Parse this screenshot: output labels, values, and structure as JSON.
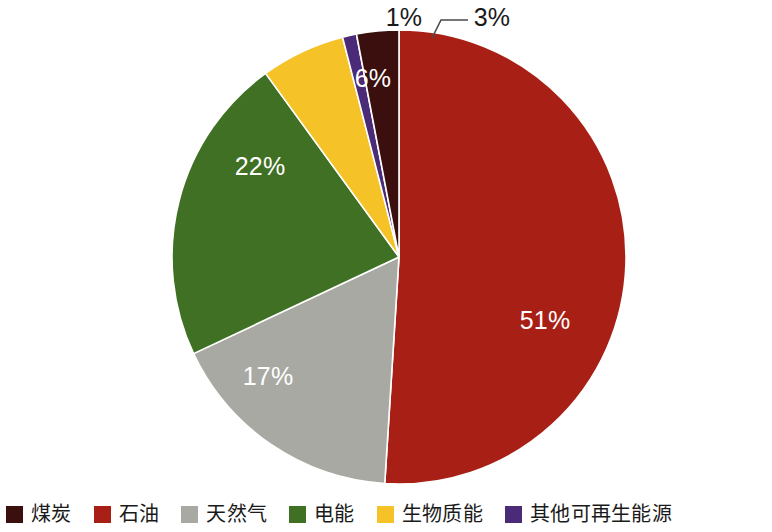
{
  "chart_data": {
    "type": "pie",
    "title": "",
    "subtitle": "",
    "xlabel": "",
    "ylabel": "",
    "legend_position": "bottom",
    "grid": false,
    "unit": "%",
    "start_angle_deg": 0,
    "direction": "clockwise",
    "categories": [
      "石油",
      "天然气",
      "电能",
      "生物质能",
      "其他可再生能源",
      "煤炭"
    ],
    "values": [
      51,
      17,
      22,
      6,
      1,
      3
    ],
    "labels": [
      "51%",
      "17%",
      "22%",
      "6%",
      "1%",
      "3%"
    ],
    "colors": [
      "#A81F16",
      "#A9A9A4",
      "#3F7024",
      "#F5C328",
      "#4B2A77",
      "#3A0F0E"
    ],
    "slices": [
      {
        "name": "石油",
        "value": 51,
        "label": "51%",
        "color": "#A81F16",
        "label_placement": "inside",
        "label_color": "#FFFFFF"
      },
      {
        "name": "天然气",
        "value": 17,
        "label": "17%",
        "color": "#A9A9A4",
        "label_placement": "inside",
        "label_color": "#FFFFFF"
      },
      {
        "name": "电能",
        "value": 22,
        "label": "22%",
        "color": "#3F7024",
        "label_placement": "inside",
        "label_color": "#FFFFFF"
      },
      {
        "name": "生物质能",
        "value": 6,
        "label": "6%",
        "color": "#F5C328",
        "label_placement": "inside",
        "label_color": "#FFFFFF"
      },
      {
        "name": "其他可再生能源",
        "value": 1,
        "label": "1%",
        "color": "#4B2A77",
        "label_placement": "outside",
        "label_color": "#1A1A1A"
      },
      {
        "name": "煤炭",
        "value": 3,
        "label": "3%",
        "color": "#3A0F0E",
        "label_placement": "outside-leader",
        "label_color": "#1A1A1A"
      }
    ]
  },
  "legend": {
    "items": [
      {
        "label": "煤炭",
        "color": "#3A0F0E"
      },
      {
        "label": "石油",
        "color": "#A81F16"
      },
      {
        "label": "天然气",
        "color": "#A9A9A4"
      },
      {
        "label": "电能",
        "color": "#3F7024"
      },
      {
        "label": "生物质能",
        "color": "#F5C328"
      },
      {
        "label": "其他可再生能源",
        "color": "#4B2A77"
      }
    ]
  },
  "labels": {
    "pct_oil": "51%",
    "pct_gas": "17%",
    "pct_electricity": "22%",
    "pct_biomass": "6%",
    "pct_other_renewable": "1%",
    "pct_coal": "3%"
  }
}
